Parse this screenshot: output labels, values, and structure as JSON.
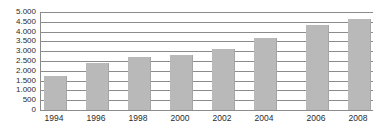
{
  "chart_data": {
    "type": "bar",
    "title": "",
    "subtitle": "",
    "xlabel": "",
    "ylabel": "",
    "categories": [
      "1994",
      "1996",
      "1998",
      "2000",
      "2002",
      "2004",
      "2006",
      "2008"
    ],
    "values": [
      1750,
      2400,
      2700,
      2820,
      3120,
      3680,
      4330,
      4650
    ],
    "series": [
      {
        "name": "",
        "values": [
          1750,
          2400,
          2700,
          2820,
          3120,
          3680,
          4330,
          4650
        ]
      }
    ],
    "ylim": [
      0,
      5000
    ],
    "ytick_step": 500,
    "ytick_values": [
      0,
      500,
      1000,
      1500,
      2000,
      2500,
      3000,
      3500,
      4000,
      4500,
      5000
    ],
    "ytick_labels": [
      "0",
      "500",
      "1.000",
      "1.500",
      "2.000",
      "2.500",
      "3.000",
      "3.500",
      "4.000",
      "4.500",
      "5.000"
    ],
    "xtick_labels": [
      "1994",
      "1996",
      "1998",
      "2000",
      "2002",
      "2004",
      "2006",
      "2008"
    ],
    "grid": true,
    "grid_axis": "y",
    "legend": false,
    "legend_position": "none",
    "annotations": [],
    "colors": {
      "bar_fill": "#b9b9b9",
      "bar_edge": "#a6a6a6",
      "gridline": "#8c8c8c",
      "axis_line": "#8c8c8c",
      "tick_label": "#2b2b2b",
      "background": "#ffffff"
    }
  }
}
